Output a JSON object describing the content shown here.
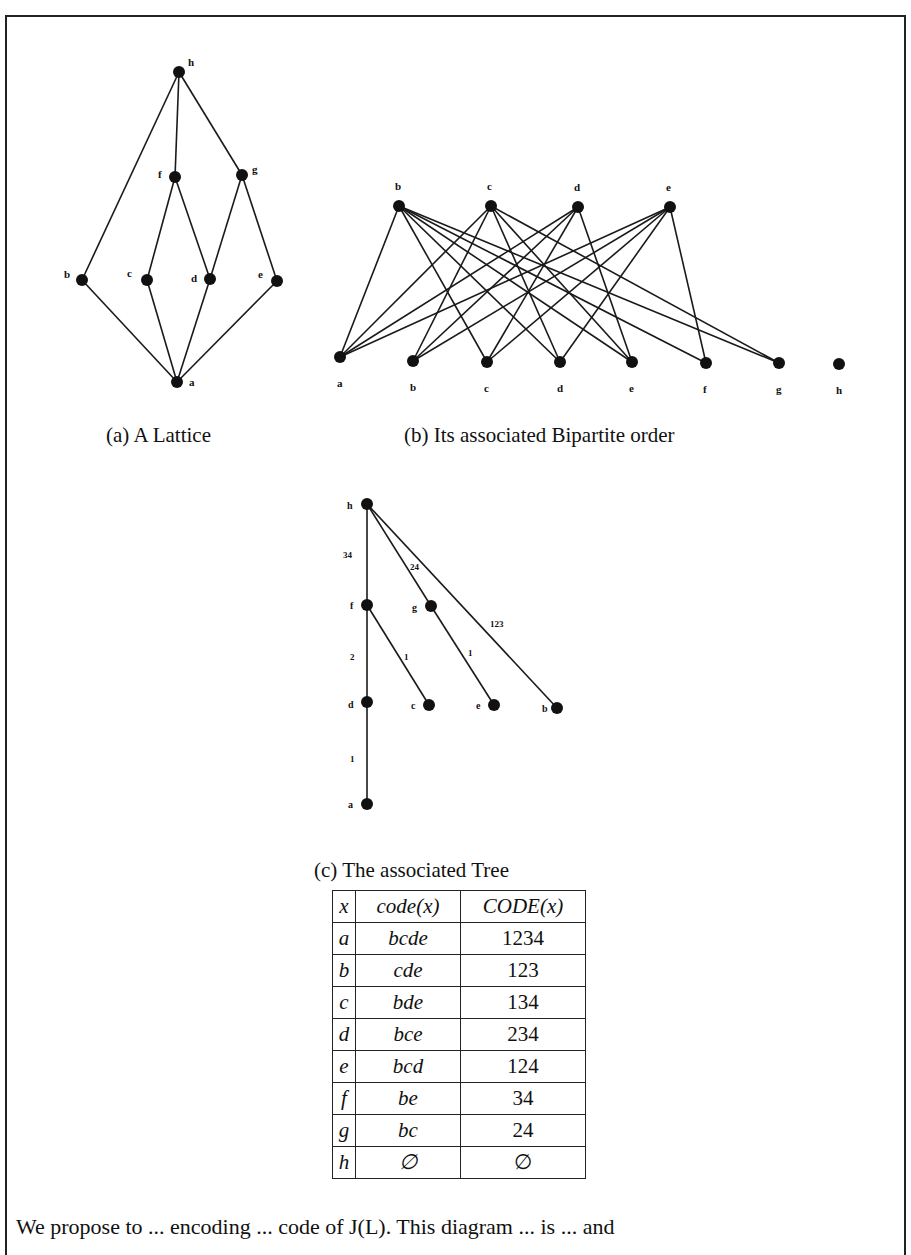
{
  "figure": {
    "lattice": {
      "caption": "(a) A Lattice",
      "nodes": [
        {
          "id": "h",
          "x": 179,
          "y": 72,
          "label": "h",
          "lx": 188,
          "ly": 66
        },
        {
          "id": "f",
          "x": 175,
          "y": 177,
          "label": "f",
          "lx": 158,
          "ly": 178
        },
        {
          "id": "g",
          "x": 242,
          "y": 175,
          "label": "g",
          "lx": 252,
          "ly": 173
        },
        {
          "id": "b",
          "x": 82,
          "y": 280,
          "label": "b",
          "lx": 64,
          "ly": 278
        },
        {
          "id": "c",
          "x": 147,
          "y": 280,
          "label": "c",
          "lx": 127,
          "ly": 277
        },
        {
          "id": "d",
          "x": 210,
          "y": 279,
          "label": "d",
          "lx": 191,
          "ly": 282
        },
        {
          "id": "e",
          "x": 277,
          "y": 281,
          "label": "e",
          "lx": 258,
          "ly": 278
        },
        {
          "id": "a",
          "x": 177,
          "y": 382,
          "label": "a",
          "lx": 189,
          "ly": 386
        }
      ],
      "edges": [
        [
          "h",
          "b"
        ],
        [
          "h",
          "f"
        ],
        [
          "h",
          "g"
        ],
        [
          "f",
          "c"
        ],
        [
          "f",
          "d"
        ],
        [
          "g",
          "d"
        ],
        [
          "g",
          "e"
        ],
        [
          "b",
          "a"
        ],
        [
          "c",
          "a"
        ],
        [
          "d",
          "a"
        ],
        [
          "e",
          "a"
        ]
      ]
    },
    "bipartite": {
      "caption": "(b) Its associated Bipartite order",
      "top_nodes": [
        {
          "id": "b",
          "x": 399,
          "y": 206,
          "label": "b"
        },
        {
          "id": "c",
          "x": 491,
          "y": 206,
          "label": "c"
        },
        {
          "id": "d",
          "x": 578,
          "y": 207,
          "label": "d"
        },
        {
          "id": "e",
          "x": 670,
          "y": 207,
          "label": "e"
        }
      ],
      "bottom_nodes": [
        {
          "id": "a",
          "x": 340,
          "y": 357,
          "label": "a"
        },
        {
          "id": "b",
          "x": 413,
          "y": 361,
          "label": "b"
        },
        {
          "id": "c",
          "x": 487,
          "y": 362,
          "label": "c"
        },
        {
          "id": "d",
          "x": 560,
          "y": 362,
          "label": "d"
        },
        {
          "id": "e",
          "x": 632,
          "y": 362,
          "label": "e"
        },
        {
          "id": "f",
          "x": 706,
          "y": 363,
          "label": "f"
        },
        {
          "id": "g",
          "x": 779,
          "y": 363,
          "label": "g"
        },
        {
          "id": "h",
          "x": 839,
          "y": 364,
          "label": "h"
        }
      ],
      "edges": [
        [
          "a",
          "b"
        ],
        [
          "a",
          "c"
        ],
        [
          "a",
          "d"
        ],
        [
          "a",
          "e"
        ],
        [
          "b",
          "c"
        ],
        [
          "b",
          "d"
        ],
        [
          "b",
          "e"
        ],
        [
          "c",
          "b"
        ],
        [
          "c",
          "d"
        ],
        [
          "c",
          "e"
        ],
        [
          "d",
          "b"
        ],
        [
          "d",
          "c"
        ],
        [
          "d",
          "e"
        ],
        [
          "e",
          "b"
        ],
        [
          "e",
          "c"
        ],
        [
          "e",
          "d"
        ],
        [
          "f",
          "b"
        ],
        [
          "f",
          "e"
        ],
        [
          "g",
          "b"
        ],
        [
          "g",
          "c"
        ]
      ]
    },
    "tree": {
      "caption": "(c) The associated Tree",
      "nodes": [
        {
          "id": "h",
          "x": 367,
          "y": 504,
          "label": "h",
          "lx": 347,
          "ly": 509
        },
        {
          "id": "f",
          "x": 367,
          "y": 605,
          "label": "f",
          "lx": 350,
          "ly": 609
        },
        {
          "id": "g",
          "x": 431,
          "y": 606,
          "label": "g",
          "lx": 412,
          "ly": 611
        },
        {
          "id": "d",
          "x": 367,
          "y": 702,
          "label": "d",
          "lx": 348,
          "ly": 708
        },
        {
          "id": "c",
          "x": 429,
          "y": 705,
          "label": "c",
          "lx": 411,
          "ly": 709
        },
        {
          "id": "e",
          "x": 494,
          "y": 705,
          "label": "e",
          "lx": 476,
          "ly": 709
        },
        {
          "id": "b",
          "x": 557,
          "y": 708,
          "label": "b",
          "lx": 542,
          "ly": 712
        },
        {
          "id": "a",
          "x": 367,
          "y": 804,
          "label": "a",
          "lx": 348,
          "ly": 808
        }
      ],
      "edges": [
        {
          "from": "h",
          "to": "f",
          "label": "34",
          "lx": 343,
          "ly": 558
        },
        {
          "from": "h",
          "to": "g",
          "label": "24",
          "lx": 410,
          "ly": 570
        },
        {
          "from": "h",
          "to": "b",
          "label": "123",
          "lx": 490,
          "ly": 627
        },
        {
          "from": "f",
          "to": "d",
          "label": "2",
          "lx": 350,
          "ly": 660
        },
        {
          "from": "f",
          "to": "c",
          "label": "1",
          "lx": 404,
          "ly": 660
        },
        {
          "from": "g",
          "to": "e",
          "label": "1",
          "lx": 468,
          "ly": 656
        },
        {
          "from": "d",
          "to": "a",
          "label": "1",
          "lx": 350,
          "ly": 762
        }
      ]
    }
  },
  "table": {
    "headers": [
      "x",
      "code(x)",
      "CODE(x)"
    ],
    "rows": [
      {
        "x": "a",
        "code": "bcde",
        "CODE": "1234"
      },
      {
        "x": "b",
        "code": "cde",
        "CODE": "123"
      },
      {
        "x": "c",
        "code": "bde",
        "CODE": "134"
      },
      {
        "x": "d",
        "code": "bce",
        "CODE": "234"
      },
      {
        "x": "e",
        "code": "bcd",
        "CODE": "124"
      },
      {
        "x": "f",
        "code": "be",
        "CODE": "34"
      },
      {
        "x": "g",
        "code": "bc",
        "CODE": "24"
      },
      {
        "x": "h",
        "code": "∅",
        "CODE": "∅"
      }
    ]
  },
  "body_text": "We propose to ... encoding ... code of J(L). This diagram ... is ... and"
}
